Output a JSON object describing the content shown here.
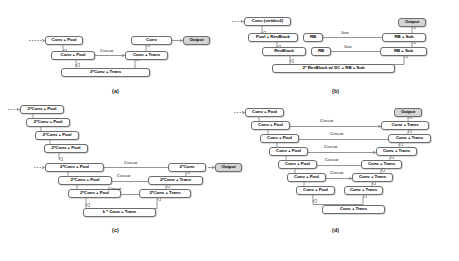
{
  "figure": {
    "caption_labels": [
      "(a)",
      "(b)",
      "(c)",
      "(d)"
    ],
    "edge_label_concat": "Concat",
    "edge_label_sum": "Sum",
    "output_label": "Output"
  },
  "panel_a": {
    "label": "(a)",
    "nodes": [
      {
        "id": "a1",
        "text": "Conv + Pool"
      },
      {
        "id": "a2",
        "text": "Conv + Pool"
      },
      {
        "id": "a3",
        "text": "2*Conv + Trans"
      },
      {
        "id": "a4",
        "text": "Conv + Trans"
      },
      {
        "id": "a5",
        "text": "Conv"
      },
      {
        "id": "a6",
        "text": "Output"
      }
    ],
    "edges": [
      {
        "label": "Concat"
      }
    ]
  },
  "panel_b": {
    "label": "(b)",
    "nodes": [
      {
        "id": "b1",
        "text": "Conv (stride=2)"
      },
      {
        "id": "b2",
        "text": "Pool + ResBlock"
      },
      {
        "id": "b3",
        "text": "ResBlock"
      },
      {
        "id": "b4",
        "text": "2* ResBlock w/ DC + RB + Sub"
      },
      {
        "id": "b5",
        "text": "RB"
      },
      {
        "id": "b6",
        "text": "RB"
      },
      {
        "id": "b7",
        "text": "RB + Sub"
      },
      {
        "id": "b8",
        "text": "RB + Sub"
      },
      {
        "id": "b9",
        "text": "Output"
      }
    ],
    "edges": [
      {
        "label": "Sum"
      },
      {
        "label": "Sum"
      }
    ]
  },
  "panel_c": {
    "label": "(c)",
    "nodes": [
      {
        "id": "c1",
        "text": "2*Conv + Pool"
      },
      {
        "id": "c2",
        "text": "2*Conv + Pool"
      },
      {
        "id": "c3",
        "text": "2*Conv + Pool"
      },
      {
        "id": "c4",
        "text": "2*Conv + Pool"
      },
      {
        "id": "c5",
        "text": "2*Conv + Pool"
      },
      {
        "id": "c6",
        "text": "2*Conv + Pool"
      },
      {
        "id": "c7",
        "text": "2*Conv + Pool"
      },
      {
        "id": "c8",
        "text": "k * Conv + Trans"
      },
      {
        "id": "c9",
        "text": "2*Conv + Trans"
      },
      {
        "id": "c10",
        "text": "2*Conv + Trans"
      },
      {
        "id": "c11",
        "text": "2*Conv"
      },
      {
        "id": "c12",
        "text": "Output"
      }
    ],
    "edges": [
      {
        "label": "Concat"
      },
      {
        "label": "Concat"
      },
      {
        "label": "Concat"
      }
    ]
  },
  "panel_d": {
    "label": "(d)",
    "nodes": [
      {
        "id": "d1",
        "text": "Conv + Pool"
      },
      {
        "id": "d2",
        "text": "Conv + Pool"
      },
      {
        "id": "d3",
        "text": "Conv + Pool"
      },
      {
        "id": "d4",
        "text": "Conv + Pool"
      },
      {
        "id": "d5",
        "text": "Conv + Pool"
      },
      {
        "id": "d6",
        "text": "Conv + Pool"
      },
      {
        "id": "d7",
        "text": "Conv + Pool"
      },
      {
        "id": "d8",
        "text": "Conv + Trans"
      },
      {
        "id": "d9",
        "text": "Conv + Trans"
      },
      {
        "id": "d10",
        "text": "Conv + Trans"
      },
      {
        "id": "d11",
        "text": "Conv + Trans"
      },
      {
        "id": "d12",
        "text": "Conv + Trans"
      },
      {
        "id": "d13",
        "text": "Conv + Trans"
      },
      {
        "id": "d14",
        "text": "Conv + Trans"
      },
      {
        "id": "d15",
        "text": "Output"
      }
    ],
    "edges": [
      {
        "label": "Concat"
      },
      {
        "label": "Concat"
      },
      {
        "label": "Concat"
      },
      {
        "label": "Concat"
      },
      {
        "label": "Concat"
      }
    ]
  }
}
